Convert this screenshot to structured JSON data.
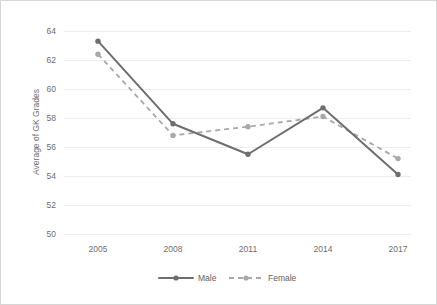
{
  "chart_data": {
    "type": "line",
    "title": "",
    "xlabel": "",
    "ylabel": "Average of GK Grades",
    "categories": [
      "2005",
      "2008",
      "2011",
      "2014",
      "2017"
    ],
    "x": [
      2005,
      2008,
      2011,
      2014,
      2017
    ],
    "ylim": [
      50,
      64
    ],
    "yticks": [
      50,
      52,
      54,
      56,
      58,
      60,
      62,
      64
    ],
    "ytick_labels": [
      "50",
      "52",
      "54",
      "56",
      "58",
      "60",
      "62",
      "64"
    ],
    "grid": "horizontal",
    "legend_position": "bottom-center",
    "series": [
      {
        "name": "Male",
        "values": [
          63.3,
          57.6,
          55.5,
          58.7,
          54.1
        ],
        "line_style": "solid",
        "color": "#6e6e6e",
        "marker": "circle"
      },
      {
        "name": "Female",
        "values": [
          62.4,
          56.8,
          57.4,
          58.1,
          55.2
        ],
        "line_style": "dashed",
        "color": "#a8a8a8",
        "marker": "circle"
      }
    ]
  },
  "axis": {
    "y_title": "Average of GK Grades",
    "y_tick_0": "50",
    "y_tick_1": "52",
    "y_tick_2": "54",
    "y_tick_3": "56",
    "y_tick_4": "58",
    "y_tick_5": "60",
    "y_tick_6": "62",
    "y_tick_7": "64",
    "x_tick_0": "2005",
    "x_tick_1": "2008",
    "x_tick_2": "2011",
    "x_tick_3": "2014",
    "x_tick_4": "2017"
  },
  "legend": {
    "entry_0": "Male",
    "entry_1": "Female"
  },
  "colors": {
    "male_line": "#6e6e6e",
    "female_line": "#a8a8a8",
    "gridline": "#ededed",
    "text": "#6d6d6d",
    "border": "#d6d6d6"
  }
}
